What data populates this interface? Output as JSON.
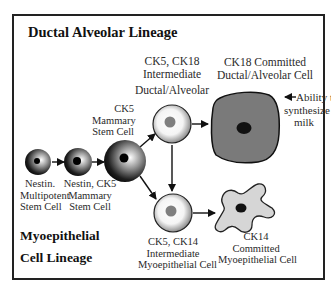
{
  "diagram": {
    "titles": {
      "ductal": "Ductal Alveolar Lineage",
      "myo_line1": "Myoepithelial",
      "myo_line2": "Cell Lineage"
    },
    "cells": {
      "nestin_multipotent": {
        "line1": "Nestin.",
        "line2": "Multipotent",
        "line3": "Stem Cell"
      },
      "nestin_ck5": {
        "line1": "Nestin, CK5",
        "line2": "Mammary",
        "line3": "Stem Cell"
      },
      "ck5_mammary": {
        "line1": "CK5",
        "line2": "Mammary",
        "line3": "Stem Cell"
      },
      "ck5_ck18_intermediate": {
        "line1": "CK5, CK18",
        "line2": "Intermediate",
        "line3": "Ductal/Alveolar"
      },
      "ck18_committed": {
        "line1": "CK18 Committed",
        "line2": "Ductal/Alveolar Cell"
      },
      "ck5_ck14_intermediate": {
        "line1": "CK5, CK14",
        "line2": "Intermediate",
        "line3": "Myoepithelial Cell"
      },
      "ck14_committed": {
        "line1": "CK14",
        "line2": "Committed",
        "line3": "Myoepithelial Cell"
      }
    },
    "annotation": {
      "line1": "Ability to",
      "line2": "synthesize",
      "line3": "milk"
    },
    "colors": {
      "frame": "#222222",
      "ductal_cell_fill": "#7a7a7a",
      "myo_cell_fill": "#d6d6d6",
      "nucleus": "#111111",
      "intermediate_nucleus": "#7f7f7f"
    }
  }
}
